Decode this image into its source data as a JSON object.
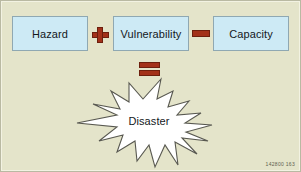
{
  "diagram": {
    "background_color": "#e4e4ca",
    "border_color": "#b9b9a2",
    "box_fill_color": "#cdeaf5",
    "box_border_color": "#8fa8b2",
    "operator_color": "#a33119",
    "operator_border_color": "#6d1f0d",
    "burst_fill_color": "#ffffff",
    "burst_stroke_color": "#585850",
    "terms": [
      {
        "id": "hazard",
        "label": "Hazard"
      },
      {
        "id": "vulnerability",
        "label": "Vulnerability"
      },
      {
        "id": "capacity",
        "label": "Capacity"
      }
    ],
    "operators": [
      {
        "id": "plus",
        "symbol": "+",
        "name": "plus-operator"
      },
      {
        "id": "minus",
        "symbol": "−",
        "name": "minus-operator"
      },
      {
        "id": "equals",
        "symbol": "=",
        "name": "equals-operator"
      }
    ],
    "result": {
      "label": "Disaster",
      "shape": "starburst"
    },
    "corner_code": "142800 163"
  }
}
